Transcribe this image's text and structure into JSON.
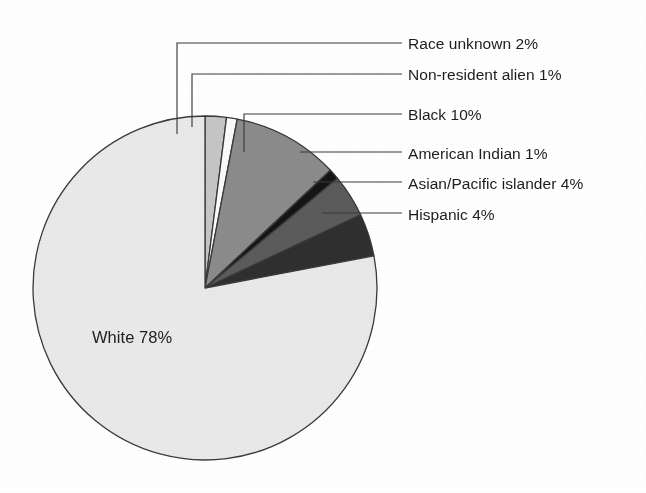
{
  "chart_data": {
    "type": "pie",
    "title": "",
    "subtitle": "",
    "xlabel": "",
    "ylabel": "",
    "legend_position": "callout-right",
    "grid": false,
    "units": "percent",
    "total": 100,
    "categories": [
      "Race unknown",
      "Non-resident alien",
      "Black",
      "American Indian",
      "Asian/Pacific islander",
      "Hispanic",
      "White"
    ],
    "values": [
      2,
      1,
      10,
      1,
      4,
      4,
      78
    ],
    "slices": [
      {
        "label": "Race unknown 2%",
        "name": "Race unknown",
        "value": 2,
        "percent_text": "2%",
        "color": "#c6c6c6",
        "start_angle": -90,
        "end_angle": -82.8,
        "callout": "elbow",
        "label_x": 408,
        "label_y": 36,
        "leader_x": 177,
        "leader_top_y": 43,
        "leader_bottom_y": 134,
        "leader_right_x": 402
      },
      {
        "label": "Non-resident alien 1%",
        "name": "Non-resident alien",
        "value": 1,
        "percent_text": "1%",
        "color": "#fbfbfb",
        "start_angle": -82.8,
        "end_angle": -79.2,
        "callout": "elbow",
        "label_x": 408,
        "label_y": 67,
        "leader_x": 192,
        "leader_top_y": 74,
        "leader_bottom_y": 127,
        "leader_right_x": 402
      },
      {
        "label": "Black 10%",
        "name": "Black",
        "value": 10,
        "percent_text": "10%",
        "color": "#8b8b8b",
        "start_angle": -79.2,
        "end_angle": -43.2,
        "callout": "elbow",
        "label_x": 408,
        "label_y": 107,
        "leader_x": 244,
        "leader_top_y": 114,
        "leader_bottom_y": 152,
        "leader_right_x": 402
      },
      {
        "label": "American Indian 1%",
        "name": "American Indian",
        "value": 1,
        "percent_text": "1%",
        "color": "#151515",
        "start_angle": -43.2,
        "end_angle": -39.6,
        "callout": "straight",
        "label_x": 408,
        "label_y": 146,
        "leader_from_x": 300,
        "leader_from_y": 152,
        "leader_to_x": 402,
        "leader_to_y": 152
      },
      {
        "label": "Asian/Pacific islander 4%",
        "name": "Asian/Pacific islander",
        "value": 4,
        "percent_text": "4%",
        "color": "#5b5b5b",
        "start_angle": -39.6,
        "end_angle": -25.2,
        "callout": "straight",
        "label_x": 408,
        "label_y": 176,
        "leader_from_x": 313,
        "leader_from_y": 182,
        "leader_to_x": 402,
        "leader_to_y": 182
      },
      {
        "label": "Hispanic 4%",
        "name": "Hispanic",
        "value": 4,
        "percent_text": "4%",
        "color": "#2f2f2f",
        "start_angle": -25.2,
        "end_angle": -10.8,
        "callout": "straight",
        "label_x": 408,
        "label_y": 207,
        "leader_from_x": 322,
        "leader_from_y": 213,
        "leader_to_x": 402,
        "leader_to_y": 213
      },
      {
        "label": "White 78%",
        "name": "White",
        "value": 78,
        "percent_text": "78%",
        "color": "#e9e9e9",
        "start_angle": -10.8,
        "end_angle": 270,
        "callout": "inside",
        "label_x": 92,
        "label_y": 328
      }
    ],
    "geometry": {
      "center_x": 205,
      "center_y": 288,
      "radius": 172,
      "stroke": "#3a3a3a",
      "stroke_width": 1.3,
      "background": "#ffffff"
    }
  }
}
